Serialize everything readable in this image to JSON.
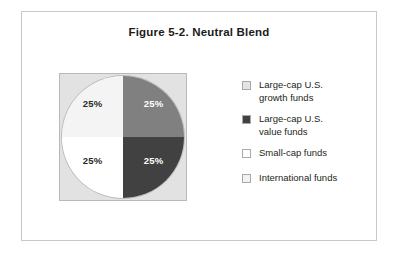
{
  "figure": {
    "title": "Figure 5-2.  Neutral Blend",
    "frame_border_color": "#c8c8c8"
  },
  "chart_data": {
    "type": "pie",
    "title": "Figure 5-2.  Neutral Blend",
    "xlabel": "",
    "ylabel": "",
    "categories": [
      "Large-cap U.S. growth funds",
      "Large-cap U.S. value funds",
      "Small-cap funds",
      "International funds"
    ],
    "values": [
      25,
      25,
      25,
      25
    ],
    "value_labels": [
      "25%",
      "25%",
      "25%",
      "25%"
    ],
    "slice_colors": [
      "#f4f4f4",
      "#808080",
      "#ffffff",
      "#414141"
    ],
    "slice_label_colors": [
      "#2a2a2a",
      "#ffffff",
      "#2a2a2a",
      "#ffffff"
    ],
    "plot_background": "#e2e2e2",
    "legend_position": "right",
    "grid": false
  },
  "pie": {
    "slices": [
      {
        "name": "top-left",
        "label": "25%",
        "fill": "#f4f4f4",
        "text_color": "#2a2a2a"
      },
      {
        "name": "top-right",
        "label": "25%",
        "fill": "#808080",
        "text_color": "#ffffff"
      },
      {
        "name": "bottom-left",
        "label": "25%",
        "fill": "#ffffff",
        "text_color": "#2a2a2a"
      },
      {
        "name": "bottom-right",
        "label": "25%",
        "fill": "#414141",
        "text_color": "#ffffff"
      }
    ]
  },
  "legend": {
    "items": [
      {
        "label": "Large-cap U.S.\ngrowth funds",
        "color": "#e4e4e4"
      },
      {
        "label": "Large-cap U.S.\nvalue funds",
        "color": "#414141"
      },
      {
        "label": "Small-cap funds",
        "color": "#ffffff"
      },
      {
        "label": "International funds",
        "color": "#f2f2f2"
      }
    ]
  }
}
